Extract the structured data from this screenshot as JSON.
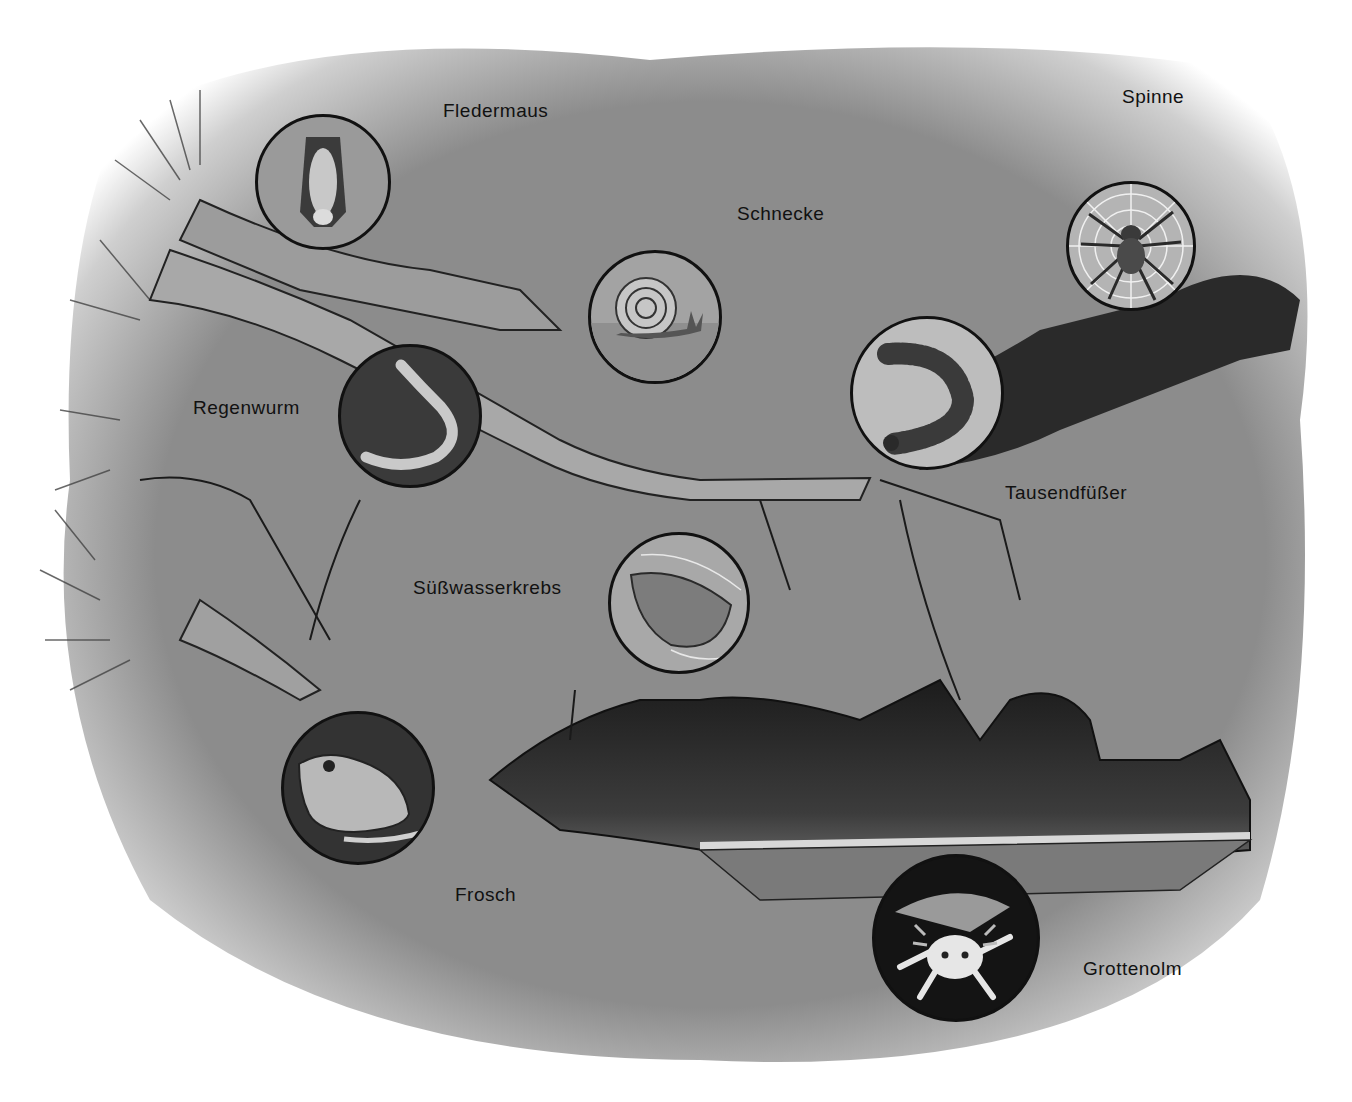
{
  "illustration": {
    "subject": "Tiere in und um Höhlen",
    "background_color": "#8f8f8f",
    "cave_dark_color": "#2a2a2a",
    "animals": [
      {
        "id": "fledermaus",
        "label": "Fledermaus",
        "icon": "bat-icon",
        "cx": 323,
        "cy": 182,
        "r": 68,
        "lx": 443,
        "ly": 100,
        "fill": "#9a9a9a"
      },
      {
        "id": "schnecke",
        "label": "Schnecke",
        "icon": "snail-icon",
        "cx": 655,
        "cy": 317,
        "r": 67,
        "lx": 737,
        "ly": 203,
        "fill": "#a3a3a3"
      },
      {
        "id": "spinne",
        "label": "Spinne",
        "icon": "spider-icon",
        "cx": 1131,
        "cy": 246,
        "r": 65,
        "lx": 1122,
        "ly": 86,
        "fill": "#b0b0b0"
      },
      {
        "id": "regenwurm",
        "label": "Regenwurm",
        "icon": "earthworm-icon",
        "cx": 410,
        "cy": 416,
        "r": 72,
        "lx": 193,
        "ly": 397,
        "fill": "#3a3a3a"
      },
      {
        "id": "tausendfuesser",
        "label": "Tausendfüßer",
        "icon": "millipede-icon",
        "cx": 927,
        "cy": 393,
        "r": 77,
        "lx": 1005,
        "ly": 482,
        "fill": "#bdbdbd"
      },
      {
        "id": "suesswasserkrebs",
        "label": "Süßwasserkrebs",
        "icon": "freshwater-shrimp-icon",
        "cx": 679,
        "cy": 603,
        "r": 71,
        "lx": 413,
        "ly": 577,
        "fill": "#a8a8a8"
      },
      {
        "id": "frosch",
        "label": "Frosch",
        "icon": "frog-icon",
        "cx": 358,
        "cy": 788,
        "r": 77,
        "lx": 455,
        "ly": 884,
        "fill": "#333333"
      },
      {
        "id": "grottenolm",
        "label": "Grottenolm",
        "icon": "olm-axolotl-icon",
        "cx": 956,
        "cy": 938,
        "r": 84,
        "lx": 1083,
        "ly": 958,
        "fill": "#141414"
      }
    ]
  }
}
